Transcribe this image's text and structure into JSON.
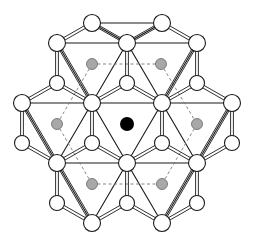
{
  "diagram": {
    "title": "",
    "colors": {
      "background": "#ffffff",
      "stroke": "#1a1a1a",
      "atom_fill": "#ffffff",
      "interstitial_fill": "#a8a8a8",
      "center_fill": "#000000",
      "dash": "#777777"
    },
    "atoms": [
      {
        "x": 92,
        "y": 23,
        "r": 8.5
      },
      {
        "x": 162,
        "y": 23,
        "r": 8.5
      },
      {
        "x": 57,
        "y": 43,
        "r": 8.5
      },
      {
        "x": 127,
        "y": 43,
        "r": 8.5
      },
      {
        "x": 197,
        "y": 43,
        "r": 8.5
      },
      {
        "x": 57,
        "y": 83,
        "r": 7.5
      },
      {
        "x": 127,
        "y": 83,
        "r": 7.5
      },
      {
        "x": 197,
        "y": 83,
        "r": 7.5
      },
      {
        "x": 22,
        "y": 103,
        "r": 8.5
      },
      {
        "x": 92,
        "y": 103,
        "r": 8.5
      },
      {
        "x": 162,
        "y": 103,
        "r": 8.5
      },
      {
        "x": 232,
        "y": 103,
        "r": 8.5
      },
      {
        "x": 22,
        "y": 143,
        "r": 7.5
      },
      {
        "x": 92,
        "y": 143,
        "r": 7.5
      },
      {
        "x": 162,
        "y": 143,
        "r": 7.5
      },
      {
        "x": 232,
        "y": 143,
        "r": 7.5
      },
      {
        "x": 57,
        "y": 163,
        "r": 8.5
      },
      {
        "x": 127,
        "y": 163,
        "r": 8.5
      },
      {
        "x": 197,
        "y": 163,
        "r": 8.5
      },
      {
        "x": 57,
        "y": 203,
        "r": 7.5
      },
      {
        "x": 127,
        "y": 203,
        "r": 7.5
      },
      {
        "x": 197,
        "y": 203,
        "r": 7.5
      },
      {
        "x": 92,
        "y": 223,
        "r": 8.5
      },
      {
        "x": 162,
        "y": 223,
        "r": 8.5
      }
    ],
    "interstitials": [
      {
        "x": 92,
        "y": 64,
        "r": 5.5
      },
      {
        "x": 161,
        "y": 64,
        "r": 5.5
      },
      {
        "x": 57,
        "y": 124,
        "r": 5.5
      },
      {
        "x": 197,
        "y": 124,
        "r": 5.5
      },
      {
        "x": 92,
        "y": 184,
        "r": 5.5
      },
      {
        "x": 162,
        "y": 184,
        "r": 5.5
      }
    ],
    "center_atom": {
      "x": 127,
      "y": 124,
      "r": 7
    },
    "triangles": [
      [
        [
          92,
          23
        ],
        [
          162,
          23
        ],
        [
          127,
          43
        ]
      ],
      [
        [
          57,
          43
        ],
        [
          127,
          43
        ],
        [
          92,
          103
        ]
      ],
      [
        [
          127,
          43
        ],
        [
          197,
          43
        ],
        [
          162,
          103
        ]
      ],
      [
        [
          22,
          103
        ],
        [
          92,
          103
        ],
        [
          57,
          163
        ]
      ],
      [
        [
          92,
          103
        ],
        [
          162,
          103
        ],
        [
          127,
          163
        ]
      ],
      [
        [
          162,
          103
        ],
        [
          232,
          103
        ],
        [
          197,
          163
        ]
      ],
      [
        [
          57,
          163
        ],
        [
          127,
          163
        ],
        [
          92,
          223
        ]
      ],
      [
        [
          127,
          163
        ],
        [
          197,
          163
        ],
        [
          162,
          223
        ]
      ]
    ],
    "solid_edges": [
      [
        [
          92,
          23
        ],
        [
          57,
          43
        ]
      ],
      [
        [
          162,
          23
        ],
        [
          197,
          43
        ]
      ],
      [
        [
          57,
          43
        ],
        [
          57,
          83
        ]
      ],
      [
        [
          127,
          43
        ],
        [
          127,
          83
        ]
      ],
      [
        [
          197,
          43
        ],
        [
          197,
          83
        ]
      ],
      [
        [
          57,
          83
        ],
        [
          22,
          103
        ]
      ],
      [
        [
          57,
          83
        ],
        [
          92,
          103
        ]
      ],
      [
        [
          127,
          83
        ],
        [
          92,
          103
        ]
      ],
      [
        [
          127,
          83
        ],
        [
          162,
          103
        ]
      ],
      [
        [
          197,
          83
        ],
        [
          162,
          103
        ]
      ],
      [
        [
          197,
          83
        ],
        [
          232,
          103
        ]
      ],
      [
        [
          22,
          103
        ],
        [
          22,
          143
        ]
      ],
      [
        [
          92,
          103
        ],
        [
          92,
          143
        ]
      ],
      [
        [
          162,
          103
        ],
        [
          162,
          143
        ]
      ],
      [
        [
          232,
          103
        ],
        [
          232,
          143
        ]
      ],
      [
        [
          22,
          143
        ],
        [
          57,
          163
        ]
      ],
      [
        [
          92,
          143
        ],
        [
          57,
          163
        ]
      ],
      [
        [
          92,
          143
        ],
        [
          127,
          163
        ]
      ],
      [
        [
          162,
          143
        ],
        [
          127,
          163
        ]
      ],
      [
        [
          162,
          143
        ],
        [
          197,
          163
        ]
      ],
      [
        [
          232,
          143
        ],
        [
          197,
          163
        ]
      ],
      [
        [
          57,
          163
        ],
        [
          57,
          203
        ]
      ],
      [
        [
          127,
          163
        ],
        [
          127,
          203
        ]
      ],
      [
        [
          197,
          163
        ],
        [
          197,
          203
        ]
      ],
      [
        [
          57,
          203
        ],
        [
          92,
          223
        ]
      ],
      [
        [
          127,
          203
        ],
        [
          92,
          223
        ]
      ],
      [
        [
          127,
          203
        ],
        [
          162,
          223
        ]
      ],
      [
        [
          197,
          203
        ],
        [
          162,
          223
        ]
      ],
      [
        [
          92,
          23
        ],
        [
          127,
          43
        ]
      ],
      [
        [
          162,
          23
        ],
        [
          127,
          43
        ]
      ],
      [
        [
          57,
          43
        ],
        [
          92,
          103
        ]
      ],
      [
        [
          197,
          43
        ],
        [
          162,
          103
        ]
      ],
      [
        [
          22,
          103
        ],
        [
          57,
          163
        ]
      ],
      [
        [
          232,
          103
        ],
        [
          197,
          163
        ]
      ],
      [
        [
          57,
          163
        ],
        [
          92,
          223
        ]
      ],
      [
        [
          197,
          163
        ],
        [
          162,
          223
        ]
      ]
    ],
    "dashed_edges": [
      [
        [
          92,
          64
        ],
        [
          161,
          64
        ]
      ],
      [
        [
          92,
          64
        ],
        [
          57,
          124
        ]
      ],
      [
        [
          161,
          64
        ],
        [
          197,
          124
        ]
      ],
      [
        [
          57,
          124
        ],
        [
          92,
          184
        ]
      ],
      [
        [
          197,
          124
        ],
        [
          162,
          184
        ]
      ],
      [
        [
          92,
          184
        ],
        [
          162,
          184
        ]
      ]
    ]
  }
}
